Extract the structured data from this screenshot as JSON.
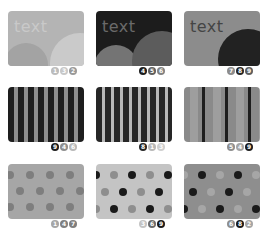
{
  "cards": [
    {
      "label": "text",
      "pattern": "circles",
      "colors": {
        "bg": "#b4b4b4",
        "text": "#c9c9c9",
        "circle_left": "#a3a3a3",
        "circle_right": "#cacaca"
      },
      "badges": [
        {
          "number": "1",
          "color": "#bcbcbc"
        },
        {
          "number": "3",
          "color": "#c8c8c8"
        },
        {
          "number": "2",
          "color": "#9a9a9a"
        }
      ],
      "badges_note": "digits read at limit of legibility; may be inaccurate"
    },
    {
      "label": "text",
      "pattern": "circles",
      "colors": {
        "bg": "#1c1c1c",
        "text": "#6a6a6a",
        "circle_left": "#747474",
        "circle_right": "#5c5c5c"
      },
      "badges": [
        {
          "number": "4",
          "color": "#1c1c1c"
        },
        {
          "number": "5",
          "color": "#5e5e5e"
        },
        {
          "number": "6",
          "color": "#828282"
        }
      ],
      "badges_note": "digits read at limit of legibility; may be inaccurate"
    },
    {
      "label": "text",
      "pattern": "circles",
      "colors": {
        "bg": "#8c8c8c",
        "text": "#444444",
        "circle_right": "#222222"
      },
      "badges": [
        {
          "number": "7",
          "color": "#8c8c8c"
        },
        {
          "number": "8",
          "color": "#262626"
        },
        {
          "number": "9",
          "color": "#5e5e5e"
        }
      ],
      "badges_note": "digits read at limit of legibility; may be inaccurate"
    },
    {
      "pattern": "stripes",
      "colors": {
        "stripe_a": "#1e1e1e",
        "stripe_b": "#8e8e8e"
      },
      "badges": [
        {
          "number": "9",
          "color": "#1c1c1c"
        },
        {
          "number": "4",
          "color": "#8e8e8e"
        },
        {
          "number": "6",
          "color": "#b8b8b8"
        }
      ],
      "badges_note": "digits read at limit of legibility; may be inaccurate"
    },
    {
      "pattern": "stripes",
      "colors": {
        "stripe_a": "#262626",
        "stripe_b": "#b8b8b8"
      },
      "badges": [
        {
          "number": "8",
          "color": "#262626"
        },
        {
          "number": "1",
          "color": "#b8b8b8"
        },
        {
          "number": "3",
          "color": "#cfcfcf"
        }
      ],
      "badges_note": "digits read at limit of legibility; may be inaccurate"
    },
    {
      "pattern": "stripes",
      "colors": {
        "stripe_a": "#8a8a8a",
        "stripe_b": "#9e9e9e",
        "stripe_c": "#1e1e1e"
      },
      "badges": [
        {
          "number": "5",
          "color": "#8e8e8e"
        },
        {
          "number": "4",
          "color": "#a4a4a4"
        },
        {
          "number": "9",
          "color": "#1c1c1c"
        }
      ],
      "badges_note": "digits read at limit of legibility; may be inaccurate"
    },
    {
      "pattern": "dots",
      "colors": {
        "bg": "#a6a6a6",
        "dot_a": "#7e7e7e",
        "dot_b": "#7e7e7e"
      },
      "badges": [
        {
          "number": "1",
          "color": "#a6a6a6"
        },
        {
          "number": "4",
          "color": "#7e7e7e"
        },
        {
          "number": "7",
          "color": "#7e7e7e"
        }
      ],
      "badges_note": "digits read at limit of legibility; may be inaccurate"
    },
    {
      "pattern": "dots",
      "colors": {
        "bg": "#c4c4c4",
        "dot_a": "#1a1a1a",
        "dot_b": "#8e8e8e"
      },
      "badges": [
        {
          "number": "3",
          "color": "#c4c4c4"
        },
        {
          "number": "6",
          "color": "#6a6a6a"
        },
        {
          "number": "9",
          "color": "#1a1a1a"
        }
      ],
      "badges_note": "digits read at limit of legibility; may be inaccurate"
    },
    {
      "pattern": "dots",
      "colors": {
        "bg": "#8e8e8e",
        "dot_a": "#1a1a1a",
        "dot_b": "#a6a6a6"
      },
      "badges": [
        {
          "number": "6",
          "color": "#8e8e8e"
        },
        {
          "number": "8",
          "color": "#1a1a1a"
        },
        {
          "number": "2",
          "color": "#a6a6a6"
        }
      ],
      "badges_note": "digits read at limit of legibility; may be inaccurate"
    }
  ]
}
